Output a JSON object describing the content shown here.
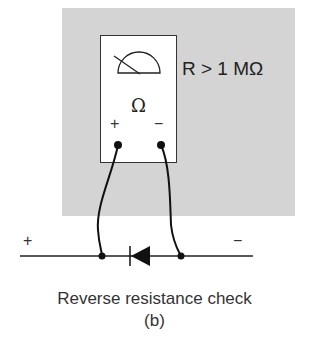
{
  "meter": {
    "reading_label": "R > 1 MΩ",
    "mode_symbol": "Ω",
    "plus_terminal": "+",
    "minus_terminal": "−"
  },
  "circuit": {
    "left_polarity": "+",
    "right_polarity": "−",
    "component": "diode (reverse biased)"
  },
  "caption": {
    "title": "Reverse resistance check",
    "sub": "(b)"
  },
  "colors": {
    "panel": "#d4d4d4",
    "ink": "#222222"
  }
}
